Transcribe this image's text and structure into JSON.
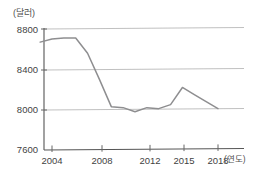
{
  "chart_data": {
    "type": "line",
    "title": "",
    "xlabel": "(연도)",
    "ylabel": "(달러)",
    "ylim": [
      7600,
      8800
    ],
    "xlim": [
      2003,
      2019
    ],
    "grid": true,
    "legend": "none",
    "y_ticks": [
      "8800",
      "8400",
      "8000",
      "7600"
    ],
    "y_tick_values": [
      8800,
      8400,
      8000,
      7600
    ],
    "x_ticks": [
      "2004",
      "2008",
      "2012",
      "2015",
      "2018"
    ],
    "x_tick_values": [
      2004,
      2008,
      2012,
      2015,
      2018
    ],
    "series": [
      {
        "name": "1인당 국민소득",
        "color": "#8e8e90",
        "x": [
          2003,
          2004,
          2005,
          2006,
          2007,
          2008,
          2009,
          2010,
          2011,
          2012,
          2013,
          2014,
          2015,
          2016,
          2017,
          2018
        ],
        "values": [
          8670,
          8700,
          8710,
          8710,
          8560,
          8300,
          8030,
          8020,
          7980,
          8020,
          8010,
          8050,
          8220,
          8150,
          8080,
          8010
        ]
      }
    ]
  },
  "axis": {
    "y_unit": "(달러)",
    "x_unit": "(연도)"
  }
}
